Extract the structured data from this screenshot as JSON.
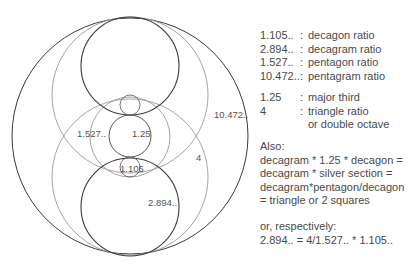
{
  "diagram": {
    "colors": {
      "dark_stroke": "#3a3a3a",
      "light_stroke": "#9a9a9a",
      "mid_stroke": "#777777",
      "text": "#555555"
    },
    "circles": [
      {
        "name": "outer-circle",
        "cx": 130,
        "cy": 136,
        "r": 118,
        "stroke": "dark"
      },
      {
        "name": "upper-large-gray-circle",
        "cx": 130,
        "cy": 95,
        "r": 78,
        "stroke": "light"
      },
      {
        "name": "lower-large-gray-circle",
        "cx": 130,
        "cy": 177,
        "r": 78,
        "stroke": "light"
      },
      {
        "name": "upper-dark-circle",
        "cx": 130,
        "cy": 66,
        "r": 49,
        "stroke": "dark"
      },
      {
        "name": "lower-dark-circle",
        "cx": 130,
        "cy": 207,
        "r": 49,
        "stroke": "dark"
      },
      {
        "name": "middle-gray-circle",
        "cx": 130,
        "cy": 137,
        "r": 40,
        "stroke": "light"
      },
      {
        "name": "center-circle",
        "cx": 130,
        "cy": 136,
        "r": 21,
        "stroke": "mid"
      },
      {
        "name": "upper-small-circle",
        "cx": 130,
        "cy": 105,
        "r": 10,
        "stroke": "mid"
      },
      {
        "name": "lower-small-circle",
        "cx": 130,
        "cy": 167,
        "r": 10,
        "stroke": "mid"
      }
    ],
    "labels": {
      "pentagon": "1.527..",
      "major_third": "1.25",
      "decagon": "1.105",
      "triangle": "4",
      "decagram": "2.894..",
      "pentagram": "10.472.."
    }
  },
  "legend": {
    "ratios": [
      {
        "value": "1.105..",
        "sep": ":",
        "label": "decagon ratio"
      },
      {
        "value": "2.894..",
        "sep": ":",
        "label": "decagram ratio"
      },
      {
        "value": "1.527..",
        "sep": ":",
        "label": "pentagon ratio"
      },
      {
        "value": "10.472..",
        "sep": ":",
        "label": "pentagram ratio"
      }
    ],
    "other": [
      {
        "value": "1.25",
        "sep": ":",
        "label": "major third"
      },
      {
        "value": "4",
        "sep": ":",
        "label": "triangle ratio"
      },
      {
        "value": "",
        "sep": "",
        "label": "or double octave"
      }
    ],
    "also": {
      "heading": "Also:",
      "lines": [
        "decagram * 1.25 * decagon =",
        "decagram * silver section =",
        "decagram*pentagon/decagon",
        "= triangle or 2 squares"
      ]
    },
    "respectively": {
      "heading": "or, respectively:",
      "formula": "2.894.. = 4/1.527.. * 1.105.."
    }
  }
}
